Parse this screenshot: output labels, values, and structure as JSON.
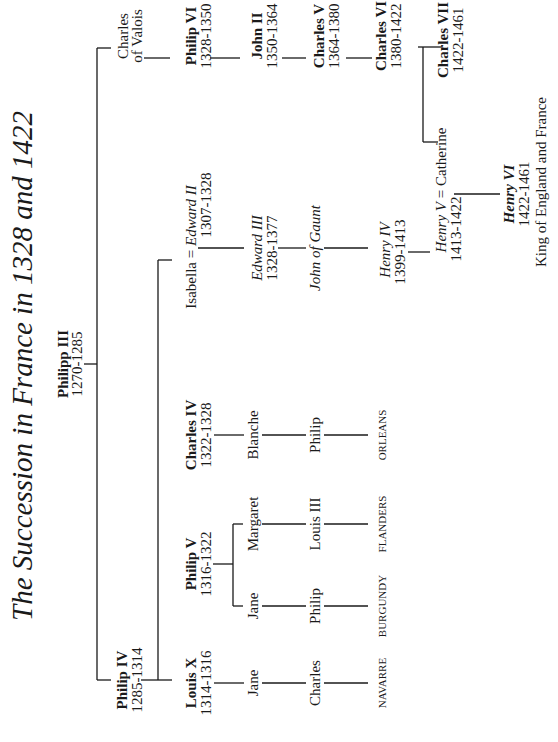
{
  "title": "The Succession in France in 1328 and 1422",
  "people": {
    "philipp_iii": {
      "name": "Philipp III",
      "dates": "1270-1285"
    },
    "philip_iv": {
      "name": "Philip IV",
      "dates": "1285-1314"
    },
    "charles_of_valois": {
      "name1": "Charles",
      "name2": "of Valois"
    },
    "louis_x": {
      "name": "Louis X",
      "dates": "1314-1316"
    },
    "philip_v": {
      "name": "Philip V",
      "dates": "1316-1322"
    },
    "charles_iv": {
      "name": "Charles IV",
      "dates": "1322-1328"
    },
    "isabella": {
      "name": "Isabella"
    },
    "edward_ii": {
      "name": "Edward II",
      "dates": "1307-1328"
    },
    "jane_lx": {
      "name": "Jane"
    },
    "jane_pv": {
      "name": "Jane"
    },
    "margaret": {
      "name": "Margaret"
    },
    "blanche": {
      "name": "Blanche"
    },
    "edward_iii": {
      "name": "Edward III",
      "dates": "1328-1377"
    },
    "charles_n": {
      "name": "Charles"
    },
    "philip_b": {
      "name": "Philip"
    },
    "louis_iii": {
      "name": "Louis III"
    },
    "philip_o": {
      "name": "Philip"
    },
    "john_of_gaunt": {
      "name": "John of Gaunt"
    },
    "henry_iv": {
      "name": "Henry IV",
      "dates": "1399-1413"
    },
    "henry_v": {
      "name": "Henry V",
      "dates": "1413-1422"
    },
    "catherine": {
      "name": "Catherine"
    },
    "henry_vi": {
      "name": "Henry VI",
      "dates": "1422-1461",
      "note": "King of England and France"
    },
    "philip_vi": {
      "name": "Philip VI",
      "dates": "1328-1350"
    },
    "john_ii": {
      "name": "John II",
      "dates": "1350-1364"
    },
    "charles_v": {
      "name": "Charles V",
      "dates": "1364-1380"
    },
    "charles_vi": {
      "name": "Charles VI",
      "dates": "1380-1422"
    },
    "charles_vii": {
      "name": "Charles VII",
      "dates": "1422-1461"
    }
  },
  "houses": [
    "NAVARRE",
    "BURGUNDY",
    "FLANDERS",
    "ORLEANS"
  ],
  "marriage_symbol": "="
}
